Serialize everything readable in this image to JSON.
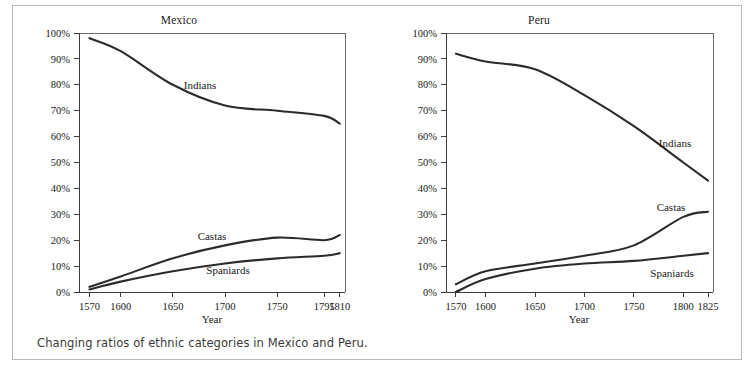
{
  "figure": {
    "caption": "Changing ratios of ethnic categories in Mexico and Peru."
  },
  "panels": [
    {
      "id": "mexico",
      "title": "Mexico",
      "xlabel": "Year",
      "series_labels": {
        "indians": "Indians",
        "castas": "Castas",
        "spaniards": "Spaniards"
      }
    },
    {
      "id": "peru",
      "title": "Peru",
      "xlabel": "Year",
      "series_labels": {
        "indians": "Indians",
        "castas": "Castas",
        "spaniards": "Spaniards"
      }
    }
  ],
  "chart_data": [
    {
      "type": "line",
      "title": "Mexico",
      "xlabel": "Year",
      "ylabel": "",
      "xlim": [
        1560,
        1815
      ],
      "ylim": [
        0,
        100
      ],
      "grid": false,
      "legend_position": "inline-labels",
      "xticks": [
        1570,
        1600,
        1650,
        1700,
        1750,
        1795,
        1810
      ],
      "xtick_labels": [
        "1570",
        "1600",
        "1650",
        "1700",
        "1750",
        "1795",
        "1810"
      ],
      "yticks": [
        0,
        10,
        20,
        30,
        40,
        50,
        60,
        70,
        80,
        90,
        100
      ],
      "ytick_labels": [
        "0%",
        "10%",
        "20%",
        "30%",
        "40%",
        "50%",
        "60%",
        "70%",
        "80%",
        "90%",
        "100%"
      ],
      "series": [
        {
          "name": "Indians",
          "x": [
            1570,
            1600,
            1650,
            1700,
            1750,
            1795,
            1810
          ],
          "values": [
            98,
            93,
            80,
            72,
            70,
            68,
            65
          ]
        },
        {
          "name": "Castas",
          "x": [
            1570,
            1600,
            1650,
            1700,
            1750,
            1795,
            1810
          ],
          "values": [
            2,
            6,
            13,
            18,
            21,
            20,
            22
          ]
        },
        {
          "name": "Spaniards",
          "x": [
            1570,
            1600,
            1650,
            1700,
            1750,
            1795,
            1810
          ],
          "values": [
            1,
            4,
            8,
            11,
            13,
            14,
            15
          ]
        }
      ]
    },
    {
      "type": "line",
      "title": "Peru",
      "xlabel": "Year",
      "ylabel": "",
      "xlim": [
        1560,
        1830
      ],
      "ylim": [
        0,
        100
      ],
      "grid": false,
      "legend_position": "inline-labels",
      "xticks": [
        1570,
        1600,
        1650,
        1700,
        1750,
        1800,
        1825
      ],
      "xtick_labels": [
        "1570",
        "1600",
        "1650",
        "1700",
        "1750",
        "1800",
        "1825"
      ],
      "yticks": [
        0,
        10,
        20,
        30,
        40,
        50,
        60,
        70,
        80,
        90,
        100
      ],
      "ytick_labels": [
        "0%",
        "10%",
        "20%",
        "30%",
        "40%",
        "50%",
        "60%",
        "70%",
        "80%",
        "90%",
        "100%"
      ],
      "series": [
        {
          "name": "Indians",
          "x": [
            1570,
            1600,
            1650,
            1700,
            1750,
            1800,
            1825
          ],
          "values": [
            92,
            89,
            86,
            76,
            64,
            50,
            43
          ]
        },
        {
          "name": "Castas",
          "x": [
            1570,
            1600,
            1650,
            1700,
            1750,
            1800,
            1825
          ],
          "values": [
            3,
            8,
            11,
            14,
            18,
            29,
            31
          ]
        },
        {
          "name": "Spaniards",
          "x": [
            1570,
            1600,
            1650,
            1700,
            1750,
            1800,
            1825
          ],
          "values": [
            0,
            5,
            9,
            11,
            12,
            14,
            15
          ]
        }
      ]
    }
  ]
}
